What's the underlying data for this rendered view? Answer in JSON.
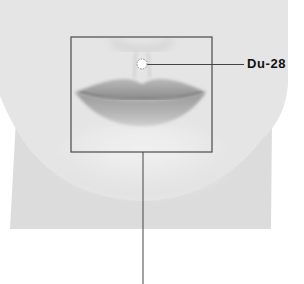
{
  "figure": {
    "highlight_box": {
      "x": 71,
      "y": 37,
      "width": 141,
      "height": 115
    },
    "colors": {
      "background": "#ffffff",
      "skin": "#e4e4e4",
      "skin_shadow": "#d6d6d6",
      "chin_highlight": "#f0f0f0",
      "lips": "#9a9a9a",
      "lip_line": "#6e6e6e",
      "leader_line": "#444444",
      "label": "#111111",
      "point_fill": "#ffffff",
      "point_border": "#888888"
    }
  },
  "acupoint": {
    "label": "Du-28",
    "marker_x": 142,
    "marker_y": 64
  }
}
